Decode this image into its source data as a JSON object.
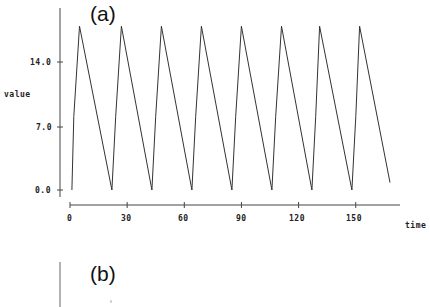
{
  "panels": {
    "a": {
      "label": "(a)"
    },
    "b": {
      "label": "(b)"
    }
  },
  "chart_data": [
    {
      "type": "line",
      "title": "(a)",
      "xlabel": "time",
      "ylabel": "value",
      "xlim": [
        0,
        172
      ],
      "ylim": [
        0,
        18
      ],
      "x_ticks": [
        0,
        30,
        60,
        90,
        120,
        150
      ],
      "x_tick_labels": [
        "0",
        "30",
        "60",
        "90",
        "120",
        "150"
      ],
      "y_ticks": [
        0,
        7,
        14
      ],
      "y_tick_labels": [
        "0.0",
        "7.0",
        "14.0"
      ],
      "grid": false,
      "legend": null,
      "series": [
        {
          "name": "value",
          "x": [
            1,
            2,
            5,
            22,
            24,
            27,
            43,
            45,
            48,
            64,
            66,
            69,
            85,
            87,
            90,
            106,
            108,
            111,
            127,
            129,
            131,
            148,
            150,
            152,
            168
          ],
          "y": [
            0,
            8,
            17.8,
            0,
            8,
            17.8,
            0,
            8,
            17.8,
            0,
            8,
            17.8,
            0,
            8,
            17.8,
            0,
            8,
            17.8,
            0,
            8,
            17.8,
            0,
            8,
            17.8,
            0.8
          ]
        }
      ]
    },
    {
      "type": "line",
      "title": "(b)",
      "note": "panel cut off at bottom of image; only title and start of y-axis visible",
      "series": []
    }
  ]
}
